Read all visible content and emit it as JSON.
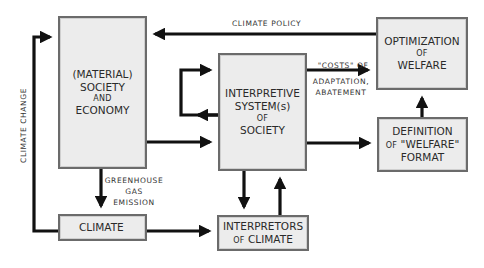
{
  "diagram": {
    "nodes": {
      "material": {
        "line1": "(MATERIAL)",
        "line2": "SOCIETY",
        "line3": "AND",
        "line4": "ECONOMY"
      },
      "interpretive": {
        "line1": "INTERPRETIVE",
        "line2": "SYSTEM(s)",
        "line3": "OF",
        "line4": "SOCIETY"
      },
      "optimization": {
        "line1": "OPTIMIZATION",
        "line2": "OF",
        "line3": "WELFARE"
      },
      "definition": {
        "line1": "DEFINITION",
        "line2a": "OF",
        "line2b": "\"WELFARE\"",
        "line3": "FORMAT"
      },
      "climate": {
        "line1": "CLIMATE"
      },
      "interpretors": {
        "line1": "INTERPRETORS",
        "line2a": "OF",
        "line2b": "CLIMATE"
      }
    },
    "edge_labels": {
      "climate_policy": "CLIMATE POLICY",
      "costs_line1": "\"COSTS\" OF",
      "costs_line2": "ADAPTATION,",
      "costs_line3": "ABATEMENT",
      "ghg_line1": "GREENHOUSE",
      "ghg_line2": "GAS",
      "ghg_line3": "EMISSION",
      "climate_change": "CLIMATE CHANGE"
    },
    "edges": [
      {
        "from": "optimization",
        "to": "material",
        "label": "CLIMATE POLICY"
      },
      {
        "from": "climate",
        "to": "material",
        "label": "CLIMATE CHANGE"
      },
      {
        "from": "material",
        "to": "climate",
        "label": "GREENHOUSE GAS EMISSION"
      },
      {
        "from": "material",
        "to": "interpretive"
      },
      {
        "from": "interpretive",
        "to": "interpretive",
        "label": "self-loop"
      },
      {
        "from": "interpretive",
        "to": "optimization",
        "label": "\"COSTS\" OF ADAPTATION, ABATEMENT"
      },
      {
        "from": "interpretive",
        "to": "definition"
      },
      {
        "from": "definition",
        "to": "optimization"
      },
      {
        "from": "interpretive",
        "to": "interpretors"
      },
      {
        "from": "interpretors",
        "to": "interpretive"
      },
      {
        "from": "climate",
        "to": "interpretors"
      }
    ],
    "colors": {
      "box_fill": "#ececec",
      "box_border": "#6b6b6b",
      "arrow": "#111111",
      "text": "#2a2a2a"
    }
  }
}
